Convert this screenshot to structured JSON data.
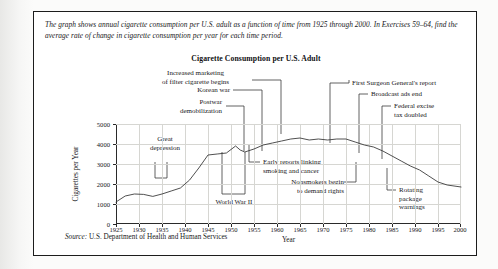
{
  "figure": {
    "intro": "The graph shows annual cigarette consumption per U.S. adult as a function of time from 1925 through 2000. In Exercises 59–64, find the average rate of change in cigarette consumption per year for each time period.",
    "title": "Cigarette Consumption per U.S. Adult",
    "source_prefix": "Source:",
    "source_text": "U.S. Department of Health and Human Services"
  },
  "chart_data": {
    "type": "line",
    "title": "Cigarette Consumption per U.S. Adult",
    "xlabel": "Year",
    "ylabel": "Cigarettes per Year",
    "xlim": [
      1925,
      2000
    ],
    "ylim": [
      0,
      5000
    ],
    "grid": true,
    "legend": "none",
    "xticks": [
      "1925",
      "1930",
      "1935",
      "1940",
      "1945",
      "1950",
      "1955",
      "1960",
      "1965",
      "1970",
      "1975",
      "1980",
      "1985",
      "1990",
      "1995",
      "2000"
    ],
    "yticks": [
      "0",
      "1000",
      "2000",
      "3000",
      "4000",
      "5000"
    ],
    "x": [
      1925,
      1927,
      1929,
      1931,
      1933,
      1935,
      1937,
      1939,
      1941,
      1943,
      1945,
      1947,
      1949,
      1951,
      1952,
      1953,
      1955,
      1957,
      1959,
      1961,
      1963,
      1965,
      1967,
      1969,
      1971,
      1973,
      1975,
      1977,
      1979,
      1981,
      1983,
      1985,
      1987,
      1989,
      1991,
      1993,
      1995,
      1997,
      2000
    ],
    "values": [
      1100,
      1400,
      1500,
      1480,
      1380,
      1500,
      1650,
      1800,
      2200,
      2800,
      3450,
      3500,
      3550,
      3900,
      3700,
      3600,
      3750,
      3950,
      4050,
      4150,
      4250,
      4300,
      4200,
      4250,
      4200,
      4250,
      4250,
      4100,
      3950,
      3850,
      3650,
      3400,
      3150,
      2900,
      2700,
      2400,
      2100,
      1950,
      1850
    ],
    "annotations": [
      {
        "label": "Great depression",
        "x_range": [
          1930,
          1932
        ]
      },
      {
        "label": "World War II",
        "x_range": [
          1941,
          1946
        ]
      },
      {
        "label": "Postwar demobilization",
        "x": 1946
      },
      {
        "label": "Korean war",
        "x": 1951
      },
      {
        "label": "Increased marketing of filter cigarette begins",
        "x": 1952
      },
      {
        "label": "Early reports linking smoking and cancer",
        "x": 1956
      },
      {
        "label": "First Surgeon General's report",
        "x": 1964
      },
      {
        "label": "Nonsmokers begin to demand rights",
        "x": 1971
      },
      {
        "label": "Broadcast ads end",
        "x": 1971
      },
      {
        "label": "Federal excise tax doubled",
        "x": 1983
      },
      {
        "label": "Rotating package warnings",
        "x": 1985
      }
    ]
  },
  "annotations": {
    "great_depression": [
      "Great",
      "depression"
    ],
    "world_war_2": "World War II",
    "postwar": [
      "Postwar",
      "demobilization"
    ],
    "korean_war": "Korean war",
    "filter_marketing": [
      "Increased marketing",
      "of filter cigarette begins"
    ],
    "early_reports": [
      "Early reports linking",
      "smoking and cancer"
    ],
    "surgeon_general": "First Surgeon General's report",
    "nonsmokers": [
      "Nonsmokers begin",
      "to demand rights"
    ],
    "broadcast_ads": "Broadcast ads end",
    "federal_excise": [
      "Federal excise",
      "tax doubled"
    ],
    "rotating_warnings": [
      "Rotating",
      "package",
      "warnings"
    ]
  }
}
